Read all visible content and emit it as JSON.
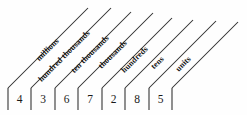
{
  "diagram": {
    "line_color": "#2b2b2b",
    "text_color": "#1a1a1a",
    "background_color": "#fefefe",
    "number": "4367285",
    "columns": [
      {
        "digit": "4",
        "place_label": "millions"
      },
      {
        "digit": "3",
        "place_label": "hundred thousands"
      },
      {
        "digit": "6",
        "place_label": "ten thousands"
      },
      {
        "digit": "7",
        "place_label": "thousands"
      },
      {
        "digit": "2",
        "place_label": "hundreds"
      },
      {
        "digit": "8",
        "place_label": "tens"
      },
      {
        "digit": "5",
        "place_label": "units"
      }
    ]
  }
}
